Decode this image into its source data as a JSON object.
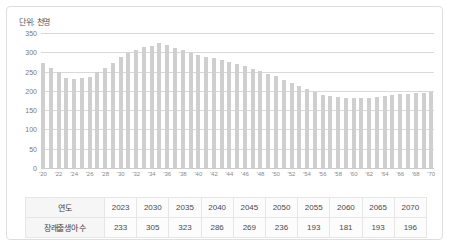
{
  "unit_label": "단위: 천명",
  "colors": {
    "bar": "#cfcfcf",
    "grid": "#d9d9d9",
    "border": "#dedede",
    "text": "#4a4a4a"
  },
  "chart_data": {
    "type": "bar",
    "title": "",
    "subtitle": "",
    "xlabel": "",
    "ylabel": "",
    "unit": "단위: 천명",
    "ylim": [
      0,
      350
    ],
    "yticks": [
      350,
      300,
      250,
      200,
      150,
      100,
      50,
      0
    ],
    "grid": true,
    "legend": "none",
    "x": [
      "2020",
      "2021",
      "2022",
      "2023",
      "2024",
      "2025",
      "2026",
      "2027",
      "2028",
      "2029",
      "2030",
      "2031",
      "2032",
      "2033",
      "2034",
      "2035",
      "2036",
      "2037",
      "2038",
      "2039",
      "2040",
      "2041",
      "2042",
      "2043",
      "2044",
      "2045",
      "2046",
      "2047",
      "2048",
      "2049",
      "2050",
      "2051",
      "2052",
      "2053",
      "2054",
      "2055",
      "2056",
      "2057",
      "2058",
      "2059",
      "2060",
      "2061",
      "2062",
      "2063",
      "2064",
      "2065",
      "2066",
      "2067",
      "2068",
      "2069",
      "2070"
    ],
    "xtick_labels": [
      "'20",
      "",
      "'22",
      "",
      "'24",
      "",
      "'26",
      "",
      "'28",
      "",
      "'30",
      "",
      "'32",
      "",
      "'34",
      "",
      "'36",
      "",
      "'38",
      "",
      "'40",
      "",
      "'42",
      "",
      "'44",
      "",
      "'46",
      "",
      "'48",
      "",
      "'50",
      "",
      "'52",
      "",
      "'54",
      "",
      "'56",
      "",
      "'58",
      "",
      "'60",
      "",
      "'62",
      "",
      "'64",
      "",
      "'66",
      "",
      "'68",
      "",
      "'70"
    ],
    "values": [
      272,
      260,
      249,
      233,
      230,
      234,
      237,
      248,
      260,
      272,
      287,
      298,
      306,
      313,
      317,
      323,
      318,
      312,
      305,
      298,
      292,
      288,
      284,
      280,
      276,
      269,
      264,
      258,
      252,
      245,
      238,
      229,
      220,
      212,
      204,
      196,
      190,
      186,
      184,
      182,
      181,
      181,
      182,
      184,
      187,
      190,
      192,
      193,
      194,
      195,
      196
    ]
  },
  "table": {
    "rows": [
      {
        "label": "연도",
        "cells": [
          "2023",
          "2030",
          "2035",
          "2040",
          "2045",
          "2050",
          "2055",
          "2060",
          "2065",
          "2070"
        ]
      },
      {
        "label": "장래출생아 수",
        "cells": [
          "233",
          "305",
          "323",
          "286",
          "269",
          "236",
          "193",
          "181",
          "193",
          "196"
        ]
      }
    ]
  }
}
